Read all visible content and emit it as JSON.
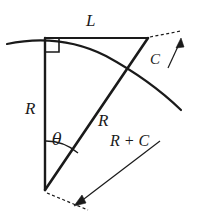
{
  "figure": {
    "background_color": "#ffffff",
    "stroke_color": "#1a1a1a",
    "labels": {
      "arc_length": "L",
      "offset": "C",
      "radius_vertical": "R",
      "angle": "θ",
      "radius_diagonal": "R",
      "radius_plus_offset": "R + C"
    },
    "elements": [
      {
        "name": "arc-curve",
        "kind": "arc"
      },
      {
        "name": "vertical-radius-line",
        "kind": "line"
      },
      {
        "name": "horizontal-chord-line",
        "kind": "line"
      },
      {
        "name": "diagonal-radius-line",
        "kind": "line"
      },
      {
        "name": "right-angle-marker",
        "kind": "square"
      },
      {
        "name": "angle-arc",
        "kind": "arc"
      },
      {
        "name": "offset-dimension",
        "kind": "dimension"
      },
      {
        "name": "total-length-dimension",
        "kind": "dimension"
      }
    ]
  }
}
